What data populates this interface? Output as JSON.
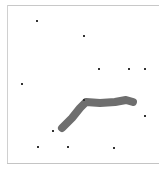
{
  "canvas": {
    "width": 159,
    "height": 170,
    "background": "#ffffff",
    "border_color": "#c8c8c8"
  },
  "dots": [
    {
      "x": 37,
      "y": 21
    },
    {
      "x": 84,
      "y": 36
    },
    {
      "x": 99,
      "y": 69
    },
    {
      "x": 129,
      "y": 69
    },
    {
      "x": 145,
      "y": 69
    },
    {
      "x": 22,
      "y": 84
    },
    {
      "x": 84,
      "y": 100
    },
    {
      "x": 145,
      "y": 116
    },
    {
      "x": 53,
      "y": 131
    },
    {
      "x": 38,
      "y": 147
    },
    {
      "x": 68,
      "y": 147
    },
    {
      "x": 114,
      "y": 148
    }
  ],
  "dot_color": "#333333",
  "stroke": {
    "color": "#6e6e6e",
    "width": 8,
    "points": [
      [
        62,
        128
      ],
      [
        72,
        118
      ],
      [
        80,
        108
      ],
      [
        86,
        102
      ],
      [
        100,
        103
      ],
      [
        115,
        102
      ],
      [
        126,
        100
      ],
      [
        133,
        102
      ]
    ]
  }
}
